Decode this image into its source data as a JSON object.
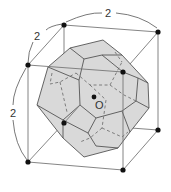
{
  "figure": {
    "labels": {
      "top_edge": "2",
      "left_depth_edge": "2",
      "left_vertical_edge": "2",
      "center": "O"
    },
    "colors": {
      "solid_fill": "#d9d9d9",
      "edge": "#555555",
      "cube_line": "#777777",
      "vertex_dot": "#111111",
      "background": "#ffffff"
    }
  }
}
